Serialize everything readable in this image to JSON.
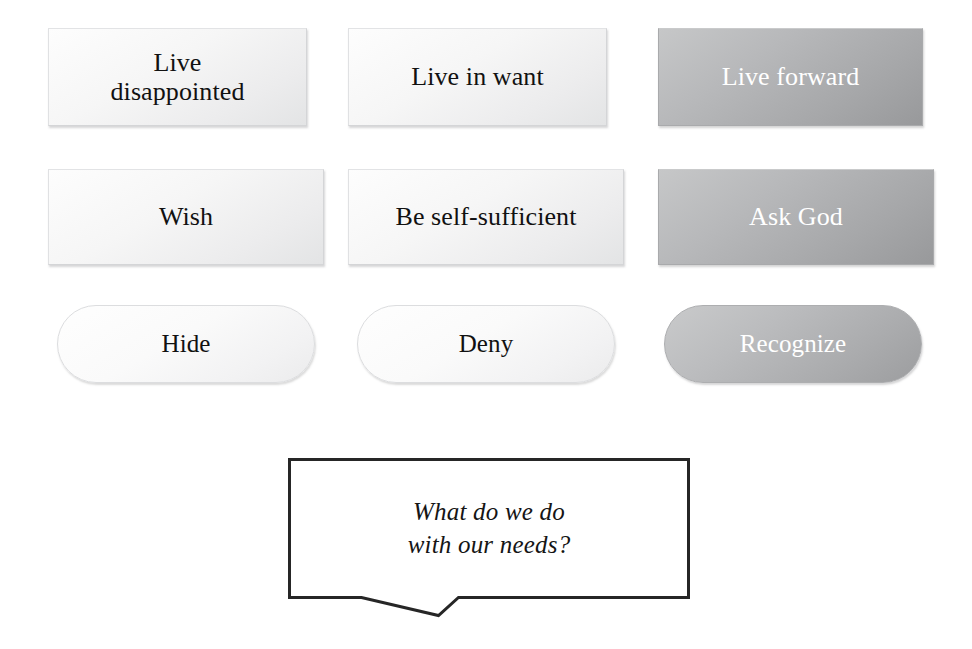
{
  "diagram": {
    "title_question": "What do we do with our needs?",
    "colors": {
      "background": "#ffffff",
      "node_light_fill": "#f4f4f5",
      "node_dark_fill": "#adaeb0",
      "node_light_text": "#111111",
      "node_dark_text": "#ffffff",
      "node_border": "#d4d5d7",
      "callout_border": "#262626",
      "callout_fill": "#ffffff"
    },
    "rows": [
      {
        "name": "row-outcomes",
        "shape": "rectangle",
        "nodes": [
          {
            "label": "Live\ndisappointed",
            "state": "unselected",
            "emphasis": "light"
          },
          {
            "label": "Live in want",
            "state": "unselected",
            "emphasis": "light"
          },
          {
            "label": "Live forward",
            "state": "selected",
            "emphasis": "dark"
          }
        ]
      },
      {
        "name": "row-responses",
        "shape": "rectangle",
        "nodes": [
          {
            "label": "Wish",
            "state": "unselected",
            "emphasis": "light"
          },
          {
            "label": "Be self-sufficient",
            "state": "unselected",
            "emphasis": "light"
          },
          {
            "label": "Ask God",
            "state": "selected",
            "emphasis": "dark"
          }
        ]
      },
      {
        "name": "row-attitudes",
        "shape": "pill",
        "nodes": [
          {
            "label": "Hide",
            "state": "unselected",
            "emphasis": "light"
          },
          {
            "label": "Deny",
            "state": "unselected",
            "emphasis": "light"
          },
          {
            "label": "Recognize",
            "state": "selected",
            "emphasis": "dark"
          }
        ]
      }
    ],
    "callout": {
      "text": "What do we do\nwith our needs?",
      "style": "speech-bubble",
      "tail": "bottom-center-notch"
    }
  }
}
